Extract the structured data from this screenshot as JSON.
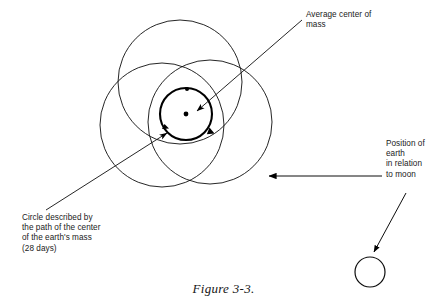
{
  "figure": {
    "caption": "Figure 3-3.",
    "labels": {
      "average_center_of_mass": "Average center of\nmass",
      "circle_described": "Circle described by\nthe path of the center\nof the earth's mass\n(28 days)",
      "position_of_earth": "Position of\nearth\nin relation\nto moon"
    },
    "colors": {
      "ink": "#000000",
      "background": "#ffffff",
      "text": "#1a1a1a"
    },
    "geometry": {
      "large_circles": [
        {
          "name": "circle-top",
          "cx": 180,
          "cy": 82,
          "r": 62
        },
        {
          "name": "circle-lower-left",
          "cx": 162,
          "cy": 125,
          "r": 62
        },
        {
          "name": "circle-lower-right",
          "cx": 210,
          "cy": 122,
          "r": 62
        }
      ],
      "bold_inner_circle": {
        "name": "earth-path-circle",
        "cx": 186,
        "cy": 114,
        "r": 26
      },
      "center_dot": {
        "cx": 186,
        "cy": 114,
        "r": 2.4
      },
      "top_marker_dot": {
        "cx": 187,
        "cy": 89,
        "r": 2.0
      },
      "moon_circle": {
        "name": "moon-circle",
        "cx": 370,
        "cy": 272,
        "r": 15
      },
      "leader_average_center": {
        "x1": 302,
        "y1": 20,
        "x2": 196,
        "y2": 110
      },
      "leader_circle_described": {
        "x1": 48,
        "y1": 208,
        "x2": 166,
        "y2": 134
      },
      "arrow_horizontal": {
        "x1": 380,
        "y1": 176,
        "x2": 268,
        "y2": 176
      },
      "arrow_to_moon": {
        "x1": 404,
        "y1": 196,
        "x2": 374,
        "y2": 254
      }
    }
  }
}
